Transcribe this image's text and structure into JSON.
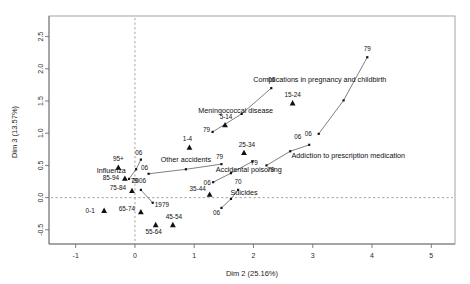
{
  "chart_data": {
    "type": "scatter",
    "title": "",
    "xlabel": "Dim 2 (25.16%)",
    "ylabel": "Dim 3 (13.57%)",
    "xlim": [
      -1.45,
      5.4
    ],
    "ylim": [
      -0.72,
      2.82
    ],
    "xticks": [
      -1,
      0,
      1,
      2,
      3,
      4,
      5
    ],
    "xtick_labels": [
      "-1",
      "0",
      "1",
      "2",
      "3",
      "4",
      "5"
    ],
    "yticks": [
      -0.5,
      0.0,
      0.5,
      1.0,
      1.5,
      2.0,
      2.5
    ],
    "ytick_labels": [
      "-0.5",
      "0.0",
      "0.5",
      "1.0",
      "1.5",
      "2.0",
      "2.5"
    ],
    "grid": false,
    "reference_lines": {
      "x": 0,
      "y": 0,
      "style": "dotted"
    },
    "legend": "none",
    "age_groups": [
      {
        "label": "0-1",
        "x": -0.52,
        "y": -0.2,
        "label_dx": -14,
        "label_dy": 2
      },
      {
        "label": "1-4",
        "x": 0.92,
        "y": 0.78,
        "label_dx": -2,
        "label_dy": -6
      },
      {
        "label": "5-14",
        "x": 1.52,
        "y": 1.13,
        "label_dx": 1,
        "label_dy": -6
      },
      {
        "label": "15-24",
        "x": 2.66,
        "y": 1.47,
        "label_dx": 0,
        "label_dy": -6
      },
      {
        "label": "25-34",
        "x": 1.84,
        "y": 0.7,
        "label_dx": 3,
        "label_dy": -6
      },
      {
        "label": "35-44",
        "x": 1.26,
        "y": 0.05,
        "label_dx": -12,
        "label_dy": -3
      },
      {
        "label": "45-54",
        "x": 0.64,
        "y": -0.42,
        "label_dx": 1,
        "label_dy": -6
      },
      {
        "label": "55-64",
        "x": 0.35,
        "y": -0.42,
        "label_dx": -2,
        "label_dy": 9
      },
      {
        "label": "65-74",
        "x": 0.1,
        "y": -0.22,
        "label_dx": -14,
        "label_dy": -1
      },
      {
        "label": "75-84",
        "x": -0.05,
        "y": 0.11,
        "label_dx": -14,
        "label_dy": -1
      },
      {
        "label": "85-94",
        "x": -0.17,
        "y": 0.3,
        "label_dx": -14,
        "label_dy": 2
      },
      {
        "label": "95+",
        "x": -0.28,
        "y": 0.47,
        "label_dx": 0,
        "label_dy": -6
      }
    ],
    "variable_trajectories": [
      {
        "name": "Influenza",
        "label_x": -0.4,
        "label_y": 0.38,
        "label_anchor": "middle",
        "points": [
          {
            "year": "79",
            "x": -0.1,
            "y": 0.29
          },
          {
            "year": "",
            "x": 0.02,
            "y": 0.44
          },
          {
            "year": "06",
            "x": 0.1,
            "y": 0.59
          }
        ],
        "year_labels": [
          {
            "text": "79",
            "x": -0.06,
            "y": 0.27,
            "dx": 3,
            "dy": 3
          },
          {
            "text": "06",
            "x": 0.1,
            "y": 0.59,
            "dx": -2,
            "dy": -5
          }
        ]
      },
      {
        "name": "Other accidents",
        "label_x": 0.86,
        "label_y": 0.56,
        "label_anchor": "middle",
        "points": [
          {
            "year": "06",
            "x": 0.23,
            "y": 0.37
          },
          {
            "year": "",
            "x": 0.86,
            "y": 0.44
          },
          {
            "year": "79",
            "x": 1.46,
            "y": 0.52
          }
        ],
        "year_labels": [
          {
            "text": "06",
            "x": 0.23,
            "y": 0.37,
            "dx": -4,
            "dy": -4
          },
          {
            "text": "79",
            "x": 1.46,
            "y": 0.52,
            "dx": -2,
            "dy": -5
          }
        ]
      },
      {
        "name": "Accidental poisoning",
        "label_x": 1.92,
        "label_y": 0.4,
        "label_anchor": "middle",
        "points": [
          {
            "year": "06",
            "x": 1.32,
            "y": 0.24
          },
          {
            "year": "",
            "x": 1.62,
            "y": 0.38
          },
          {
            "year": "79",
            "x": 1.98,
            "y": 0.56
          }
        ],
        "year_labels": [
          {
            "text": "06",
            "x": 1.32,
            "y": 0.24,
            "dx": -6,
            "dy": 3
          },
          {
            "text": "79",
            "x": 1.98,
            "y": 0.58,
            "dx": 2,
            "dy": 5
          }
        ]
      },
      {
        "name": "Suicides",
        "label_x": 1.84,
        "label_y": 0.04,
        "label_anchor": "middle",
        "points": [
          {
            "year": "06",
            "x": 1.46,
            "y": -0.16
          },
          {
            "year": "",
            "x": 1.62,
            "y": -0.02
          },
          {
            "year": "70",
            "x": 1.74,
            "y": 0.12
          }
        ],
        "year_labels": [
          {
            "text": "06",
            "x": 1.46,
            "y": -0.18,
            "dx": -5,
            "dy": 6
          },
          {
            "text": "70",
            "x": 1.74,
            "y": 0.14,
            "dx": 0,
            "dy": -5
          }
        ]
      },
      {
        "name": "Meningococcal disease",
        "label_x": 1.7,
        "label_y": 1.32,
        "label_anchor": "middle",
        "points": [
          {
            "year": "79",
            "x": 1.31,
            "y": 1.02
          },
          {
            "year": "",
            "x": 1.8,
            "y": 1.3
          },
          {
            "year": "06",
            "x": 2.3,
            "y": 1.7
          }
        ],
        "year_labels": [
          {
            "text": "79",
            "x": 1.31,
            "y": 1.02,
            "dx": -6,
            "dy": 0
          },
          {
            "text": "06",
            "x": 2.32,
            "y": 1.72,
            "dx": -1,
            "dy": -5
          }
        ]
      },
      {
        "name": "Complications in pregnancy and childbirth",
        "label_x": 3.12,
        "label_y": 1.79,
        "label_anchor": "middle",
        "points": [
          {
            "year": "06",
            "x": 3.1,
            "y": 0.99
          },
          {
            "year": "",
            "x": 3.52,
            "y": 1.51
          },
          {
            "year": "79",
            "x": 3.92,
            "y": 2.18
          }
        ],
        "year_labels": [
          {
            "text": "06",
            "x": 3.06,
            "y": 0.99,
            "dx": -8,
            "dy": 2
          },
          {
            "text": "79",
            "x": 3.92,
            "y": 2.2,
            "dx": 0,
            "dy": -5
          }
        ]
      },
      {
        "name": "Addiction to prescription medication",
        "label_x": 3.6,
        "label_y": 0.62,
        "label_anchor": "middle",
        "points": [
          {
            "year": "79",
            "x": 2.22,
            "y": 0.5
          },
          {
            "year": "",
            "x": 2.62,
            "y": 0.72
          },
          {
            "year": "06",
            "x": 2.94,
            "y": 0.82
          }
        ],
        "year_labels": [
          {
            "text": "79",
            "x": 2.24,
            "y": 0.48,
            "dx": 3,
            "dy": 5
          },
          {
            "text": "06",
            "x": 2.78,
            "y": 0.84,
            "dx": -2,
            "dy": -5
          }
        ]
      },
      {
        "name": "",
        "label_x": 0,
        "label_y": 0,
        "label_anchor": "middle",
        "points": [
          {
            "year": "2006",
            "x": 0.1,
            "y": 0.12
          },
          {
            "year": "1979",
            "x": 0.3,
            "y": -0.08
          }
        ],
        "year_labels": [
          {
            "text": "2006",
            "x": 0.12,
            "y": 0.16,
            "dx": -3,
            "dy": -4
          },
          {
            "text": "1979",
            "x": 0.32,
            "y": -0.1,
            "dx": 8,
            "dy": 3
          }
        ]
      }
    ]
  }
}
